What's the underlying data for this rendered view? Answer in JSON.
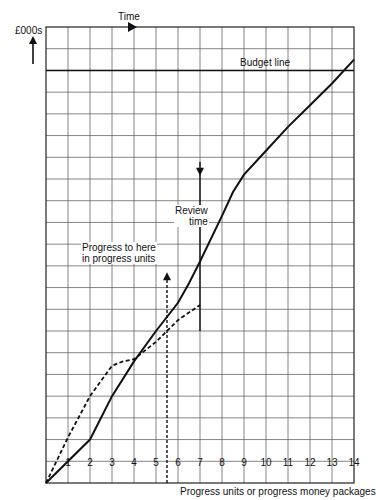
{
  "chart_data": {
    "type": "line",
    "title": "",
    "xlabel": "Progress units or progress money packages",
    "ylabel": "£000s",
    "top_axis_label": "Time",
    "x_ticks": [
      "1",
      "2",
      "3",
      "4",
      "5",
      "6",
      "7",
      "8",
      "9",
      "10",
      "11",
      "12",
      "13",
      "14"
    ],
    "xlim": [
      0,
      14
    ],
    "ylim": [
      0,
      21
    ],
    "grid": true,
    "budget_line": {
      "label": "Budget line",
      "y": 19
    },
    "series": [
      {
        "name": "Planned expenditure (S-curve)",
        "style": "solid",
        "points": [
          [
            0,
            0
          ],
          [
            2,
            2
          ],
          [
            3,
            4
          ],
          [
            4,
            5.6
          ],
          [
            5,
            7
          ],
          [
            6,
            8.3
          ],
          [
            6.5,
            9.2
          ],
          [
            7,
            10.2
          ],
          [
            8,
            12.3
          ],
          [
            8.5,
            13.4
          ],
          [
            9,
            14.2
          ],
          [
            10,
            15.3
          ],
          [
            11,
            16.4
          ],
          [
            12,
            17.4
          ],
          [
            13,
            18.4
          ],
          [
            14,
            19.5
          ]
        ]
      },
      {
        "name": "Actual expenditure",
        "style": "dashed",
        "points": [
          [
            0,
            0
          ],
          [
            1,
            2.1
          ],
          [
            2,
            4
          ],
          [
            3,
            5.4
          ],
          [
            3.5,
            5.6
          ],
          [
            4,
            5.7
          ],
          [
            5,
            6.5
          ],
          [
            6,
            7.5
          ],
          [
            7,
            8.2
          ]
        ]
      }
    ],
    "annotations": [
      {
        "text": "Review time",
        "x": 7,
        "y_from": 7.0,
        "y_to": 14.8,
        "arrow": "down"
      },
      {
        "text": "Progress to here in progress units",
        "x": 5.5,
        "y_from": 0,
        "y_to": 9.7,
        "arrow": "up",
        "style": "dashed"
      }
    ]
  },
  "labels": {
    "y_axis": "£000s",
    "top_axis": "Time",
    "budget": "Budget line",
    "review_line1": "Review",
    "review_line2": "time",
    "progress_line1": "Progress to here",
    "progress_line2": "in progress units",
    "x_axis": "Progress units or progress money packages"
  },
  "colors": {
    "ink": "#111111",
    "grid": "#555555",
    "background": "#ffffff"
  }
}
